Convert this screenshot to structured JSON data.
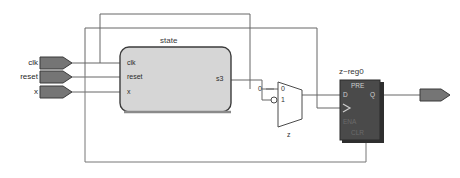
{
  "diagram": {
    "background_color": "#ffffff",
    "wire_color": "#555555",
    "block_fill": "#d6d6d6",
    "block_stroke": "#3c3c3c",
    "register_fill": "#4a4a4a",
    "pin_fill": "#6f6f6f"
  },
  "inputs": [
    {
      "name": "clk",
      "label": "clk"
    },
    {
      "name": "reset",
      "label": "reset"
    },
    {
      "name": "x",
      "label": "x"
    }
  ],
  "state_block": {
    "title": "state",
    "input_ports": [
      {
        "label": "clk"
      },
      {
        "label": "reset"
      },
      {
        "label": "x"
      }
    ],
    "output_ports": [
      {
        "label": "s3"
      }
    ]
  },
  "mux": {
    "select_label": "0",
    "data_in_0": "0",
    "data_in_1": "1",
    "output_label": "z"
  },
  "register": {
    "title": "z~reg0",
    "pre_label": "PRE",
    "d_label": "D",
    "q_label": "Q",
    "ena_label": "ENA",
    "clr_label": "CLR"
  },
  "output_pin": {
    "label": ""
  }
}
